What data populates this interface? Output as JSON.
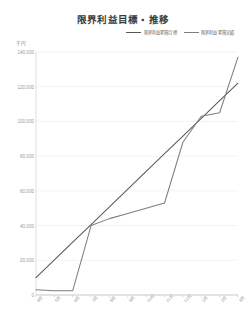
{
  "chart": {
    "title": "限界利益目標・推移",
    "unit_label": "千円",
    "legend": [
      {
        "label": "限界利益累積目標",
        "color": "#595959",
        "key": "target"
      },
      {
        "label": "限界利益累積実績",
        "color": "#7f7f7f",
        "key": "actual"
      }
    ]
  },
  "chart_data": {
    "type": "line",
    "title": "限界利益目標・推移",
    "xlabel": "",
    "ylabel": "千円",
    "ylim": [
      0,
      140000
    ],
    "yticks": [
      0,
      20000,
      40000,
      60000,
      80000,
      100000,
      120000,
      140000
    ],
    "ytick_labels": [
      "0",
      "20,000",
      "40,000",
      "60,000",
      "80,000",
      "100,000",
      "120,000",
      "140,000"
    ],
    "grid": true,
    "legend_position": "top-right",
    "categories": [
      "4月",
      "5月",
      "6月",
      "7月",
      "8月",
      "9月",
      "10月",
      "11月",
      "12月",
      "1月",
      "2月",
      "3月"
    ],
    "series": [
      {
        "name": "限界利益累積目標",
        "color": "#595959",
        "values": [
          10000,
          20200,
          30400,
          40600,
          50800,
          61000,
          71200,
          81400,
          91600,
          101800,
          112000,
          122000
        ]
      },
      {
        "name": "限界利益累積実績",
        "color": "#7f7f7f",
        "values": [
          3000,
          2500,
          2500,
          40000,
          44000,
          47000,
          50000,
          53000,
          88000,
          103000,
          105000,
          137000
        ]
      }
    ]
  }
}
